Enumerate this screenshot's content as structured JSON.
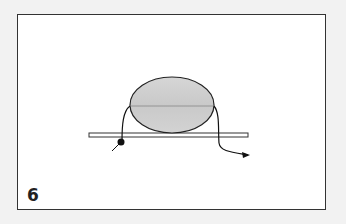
{
  "step": {
    "number": "6"
  },
  "diagram": {
    "colors": {
      "frame_border": "#333333",
      "oval_fill": "#d0d0d0",
      "oval_stroke": "#222222",
      "bar_stroke": "#333333",
      "thread": "#111111",
      "knot": "#111111"
    }
  }
}
